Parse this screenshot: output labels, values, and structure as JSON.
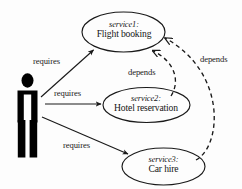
{
  "diagram": {
    "type": "service-dependency-use-case-diagram",
    "background_color": "#fdfdfd",
    "line_color": "#1a1a1a",
    "actor": {
      "name": "user-actor",
      "shape": "stick-figure-pictogram",
      "fill_color": "#000000"
    },
    "nodes": [
      {
        "key": "service1",
        "id_label": "service1:",
        "name_label": "Flight booking",
        "shape": "ellipse"
      },
      {
        "key": "service2",
        "id_label": "service2:",
        "name_label": "Hotel reservation",
        "shape": "ellipse"
      },
      {
        "key": "service3",
        "id_label": "service3:",
        "name_label": "Car hire",
        "shape": "ellipse"
      }
    ],
    "edges": [
      {
        "key": "requires_1",
        "label": "requires",
        "from": "user-actor",
        "to": "service1",
        "style": "solid",
        "arrow": "filled"
      },
      {
        "key": "requires_2",
        "label": "requires",
        "from": "user-actor",
        "to": "service2",
        "style": "solid",
        "arrow": "filled"
      },
      {
        "key": "requires_3",
        "label": "requires",
        "from": "user-actor",
        "to": "service3",
        "style": "solid",
        "arrow": "filled"
      },
      {
        "key": "depends_1",
        "label": "depends",
        "from": "service2",
        "to": "service1",
        "style": "dashed",
        "arrow": "open"
      },
      {
        "key": "depends_2",
        "label": "depends",
        "from": "service3",
        "to": "service1",
        "style": "dashed",
        "arrow": "open"
      }
    ]
  }
}
